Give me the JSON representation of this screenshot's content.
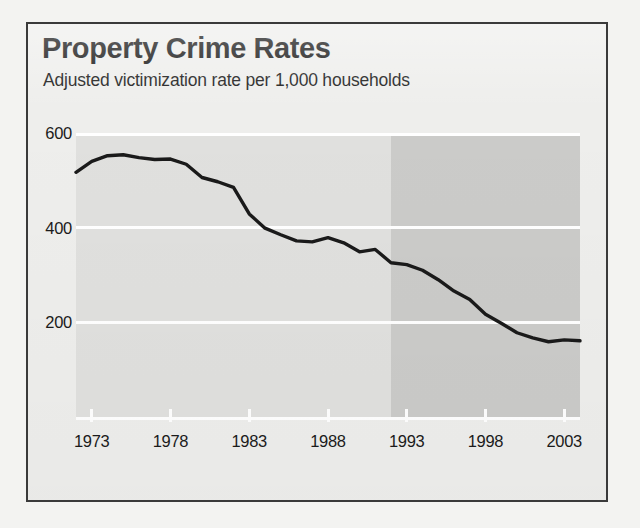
{
  "panel": {
    "title": "Property Crime Rates",
    "subtitle": "Adjusted victimization rate per 1,000 households"
  },
  "chart_data": {
    "type": "line",
    "title": "Property Crime Rates",
    "subtitle": "Adjusted victimization rate per 1,000 households",
    "xlabel": "",
    "ylabel": "",
    "ylim": [
      0,
      600
    ],
    "xlim": [
      1972,
      2004
    ],
    "grid": true,
    "legend": null,
    "ytick_labels": [
      "600",
      "400",
      "200"
    ],
    "ytick_values": [
      600,
      400,
      200
    ],
    "xtick_labels": [
      "1973",
      "1978",
      "1983",
      "1988",
      "1993",
      "1998",
      "2003"
    ],
    "xtick_values": [
      1973,
      1978,
      1983,
      1988,
      1993,
      1998,
      2003
    ],
    "series": [
      {
        "name": "Property crime victimization rate",
        "color": "#1a1a1a",
        "x": [
          1972,
          1973,
          1974,
          1975,
          1976,
          1977,
          1978,
          1979,
          1980,
          1981,
          1982,
          1983,
          1984,
          1985,
          1986,
          1987,
          1988,
          1989,
          1990,
          1991,
          1992,
          1993,
          1994,
          1995,
          1996,
          1997,
          1998,
          1999,
          2000,
          2001,
          2002,
          2003,
          2004
        ],
        "values": [
          517,
          540,
          552,
          554,
          548,
          544,
          545,
          534,
          506,
          497,
          485,
          429,
          399,
          385,
          372,
          370,
          379,
          368,
          349,
          354,
          326,
          322,
          310,
          290,
          266,
          248,
          217,
          198,
          178,
          167,
          159,
          163,
          161
        ]
      }
    ],
    "shaded_region": {
      "label": "redesign period",
      "x_start": 1992,
      "x_end": 2004,
      "color": "#cbcbc9"
    },
    "plot_background": "#e0e0de",
    "gridline_color": "#ffffff"
  }
}
